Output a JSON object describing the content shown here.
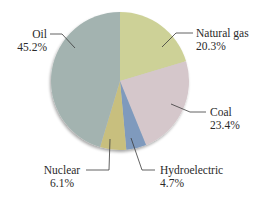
{
  "chart_data": {
    "type": "pie",
    "title": "",
    "start_angle_deg": 0,
    "direction": "clockwise",
    "slices": [
      {
        "label": "Natural gas",
        "value": 20.3,
        "display": "20.3%",
        "color": "#cdd197"
      },
      {
        "label": "Coal",
        "value": 23.4,
        "display": "23.4%",
        "color": "#d5c7cb"
      },
      {
        "label": "Hydroelectric",
        "value": 4.7,
        "display": "4.7%",
        "color": "#7f9abd"
      },
      {
        "label": "Nuclear",
        "value": 6.1,
        "display": "6.1%",
        "color": "#c8bf7e"
      },
      {
        "label": "Oil",
        "value": 45.2,
        "display": "45.2%",
        "color": "#a3b3b0"
      }
    ],
    "legend": "none (leader-line labels)",
    "categories": [
      "Natural gas",
      "Coal",
      "Hydroelectric",
      "Nuclear",
      "Oil"
    ],
    "values": [
      20.3,
      23.4,
      4.7,
      6.1,
      45.2
    ]
  },
  "labels": {
    "oil": {
      "name": "Oil",
      "pct": "45.2%"
    },
    "gas": {
      "name": "Natural gas",
      "pct": "20.3%"
    },
    "coal": {
      "name": "Coal",
      "pct": "23.4%"
    },
    "hydro": {
      "name": "Hydroelectric",
      "pct": "4.7%"
    },
    "nuclear": {
      "name": "Nuclear",
      "pct": "6.1%"
    }
  }
}
